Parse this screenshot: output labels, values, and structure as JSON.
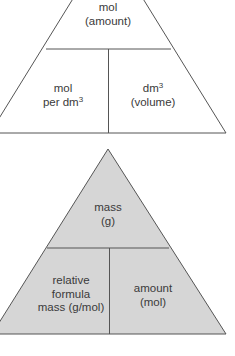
{
  "diagrams": [
    {
      "name": "concentration-triangle",
      "fill": "#ffffff",
      "stroke": "#555555",
      "top": {
        "line1": "mol",
        "line2": "(amount)"
      },
      "bottom_left": {
        "line1": "mol",
        "line2_prefix": "per dm",
        "line2_sup": "3"
      },
      "bottom_right": {
        "line1_prefix": "dm",
        "line1_sup": "3",
        "line2": "(volume)"
      }
    },
    {
      "name": "mass-triangle",
      "fill": "#d6d6d6",
      "stroke": "#555555",
      "top": {
        "line1": "mass",
        "line2": "(g)"
      },
      "bottom_left": {
        "line1": "relative",
        "line2": "formula",
        "line3": "mass (g/mol)"
      },
      "bottom_right": {
        "line1": "amount",
        "line2": "(mol)"
      }
    }
  ]
}
